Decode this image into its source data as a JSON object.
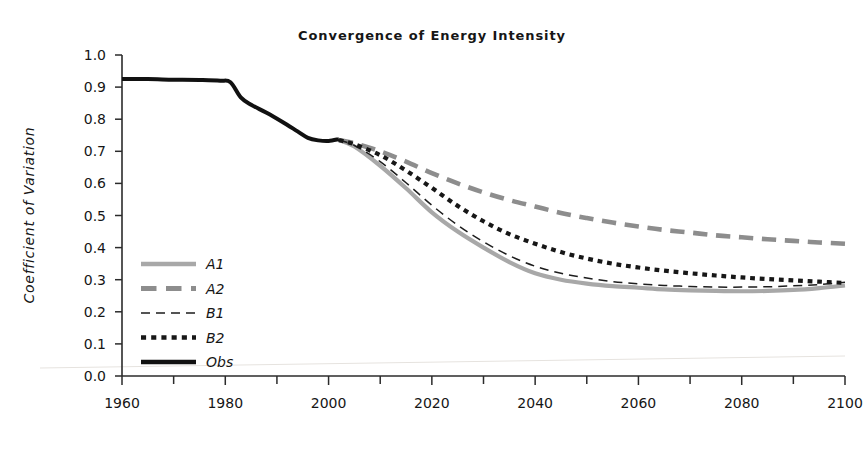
{
  "chart_data": {
    "type": "line",
    "title": "Convergence of Energy Intensity",
    "xlabel": "",
    "ylabel": "Coefficient of Variation",
    "xlim": [
      1960,
      2100
    ],
    "ylim": [
      0.0,
      1.0
    ],
    "grid": false,
    "legend_position": "inner-left",
    "x_ticks": [
      1960,
      1980,
      2000,
      2020,
      2040,
      2060,
      2080,
      2100
    ],
    "x_tick_labels": [
      "1960",
      "1980",
      "2000",
      "2020",
      "2040",
      "2060",
      "2080",
      "2100"
    ],
    "x_minor_tick_step": 10,
    "y_ticks": [
      0.0,
      0.1,
      0.2,
      0.3,
      0.4,
      0.5,
      0.6,
      0.7,
      0.8,
      0.9,
      1.0
    ],
    "y_tick_labels": [
      "0.0",
      "0.1",
      "0.2",
      "0.3",
      "0.4",
      "0.5",
      "0.6",
      "0.7",
      "0.8",
      "0.9",
      "1.0"
    ],
    "series": [
      {
        "name": "A1",
        "style": "solid",
        "color": "#a8a8a8",
        "width": 4.2,
        "x": [
          2002,
          2005,
          2010,
          2015,
          2020,
          2025,
          2030,
          2035,
          2040,
          2045,
          2050,
          2055,
          2060,
          2065,
          2070,
          2075,
          2080,
          2085,
          2090,
          2095,
          2100
        ],
        "values": [
          0.735,
          0.715,
          0.655,
          0.585,
          0.51,
          0.45,
          0.4,
          0.355,
          0.32,
          0.3,
          0.288,
          0.28,
          0.275,
          0.27,
          0.267,
          0.265,
          0.264,
          0.265,
          0.268,
          0.274,
          0.282
        ]
      },
      {
        "name": "A2",
        "style": "dashed-thick",
        "color": "#8d8d8d",
        "width": 4.6,
        "x": [
          2002,
          2005,
          2010,
          2015,
          2020,
          2025,
          2030,
          2035,
          2040,
          2045,
          2050,
          2055,
          2060,
          2065,
          2070,
          2075,
          2080,
          2085,
          2090,
          2095,
          2100
        ],
        "values": [
          0.735,
          0.725,
          0.7,
          0.668,
          0.632,
          0.6,
          0.572,
          0.548,
          0.528,
          0.508,
          0.492,
          0.478,
          0.466,
          0.455,
          0.447,
          0.438,
          0.432,
          0.426,
          0.421,
          0.416,
          0.412
        ]
      },
      {
        "name": "B1",
        "style": "dashed-thin",
        "color": "#1d1d1d",
        "width": 1.5,
        "x": [
          2002,
          2005,
          2010,
          2015,
          2020,
          2025,
          2030,
          2035,
          2040,
          2045,
          2050,
          2055,
          2060,
          2065,
          2070,
          2075,
          2080,
          2085,
          2090,
          2095,
          2100
        ],
        "values": [
          0.735,
          0.718,
          0.668,
          0.602,
          0.532,
          0.47,
          0.418,
          0.375,
          0.342,
          0.32,
          0.305,
          0.294,
          0.287,
          0.282,
          0.279,
          0.277,
          0.277,
          0.278,
          0.281,
          0.285,
          0.292
        ]
      },
      {
        "name": "B2",
        "style": "dotted",
        "color": "#171717",
        "width": 4.2,
        "x": [
          2002,
          2005,
          2010,
          2015,
          2020,
          2025,
          2030,
          2035,
          2040,
          2045,
          2050,
          2055,
          2060,
          2065,
          2070,
          2075,
          2080,
          2085,
          2090,
          2095,
          2100
        ],
        "values": [
          0.735,
          0.722,
          0.688,
          0.64,
          0.586,
          0.53,
          0.482,
          0.442,
          0.412,
          0.386,
          0.366,
          0.35,
          0.338,
          0.328,
          0.32,
          0.313,
          0.307,
          0.302,
          0.298,
          0.294,
          0.29
        ]
      },
      {
        "name": "Obs",
        "style": "solid",
        "color": "#111111",
        "width": 4.0,
        "x": [
          1960,
          1965,
          1970,
          1975,
          1979,
          1981,
          1983,
          1985,
          1988,
          1991,
          1994,
          1996,
          1998,
          2000,
          2002
        ],
        "values": [
          0.925,
          0.925,
          0.923,
          0.922,
          0.92,
          0.915,
          0.868,
          0.845,
          0.82,
          0.792,
          0.762,
          0.742,
          0.734,
          0.732,
          0.738
        ]
      }
    ],
    "legend_entries": [
      {
        "label": "A1",
        "style": "solid",
        "color": "#a8a8a8",
        "width": 4.6
      },
      {
        "label": "A2",
        "style": "dashed-thick",
        "color": "#8d8d8d",
        "width": 5.0
      },
      {
        "label": "B1",
        "style": "dashed-thin",
        "color": "#1d1d1d",
        "width": 1.6
      },
      {
        "label": "B2",
        "style": "dotted",
        "color": "#171717",
        "width": 4.4
      },
      {
        "label": "Obs",
        "style": "solid",
        "color": "#111111",
        "width": 4.4
      }
    ]
  }
}
